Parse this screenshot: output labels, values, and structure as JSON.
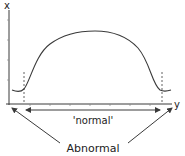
{
  "diagram": {
    "axis_labels": {
      "vertical": "x",
      "horizontal": "y"
    },
    "range_label": "'normal'",
    "outlier_label": "Abnormal",
    "colors": {
      "line": "#3a3a3a",
      "text": "#222222",
      "background": "#ffffff"
    }
  }
}
